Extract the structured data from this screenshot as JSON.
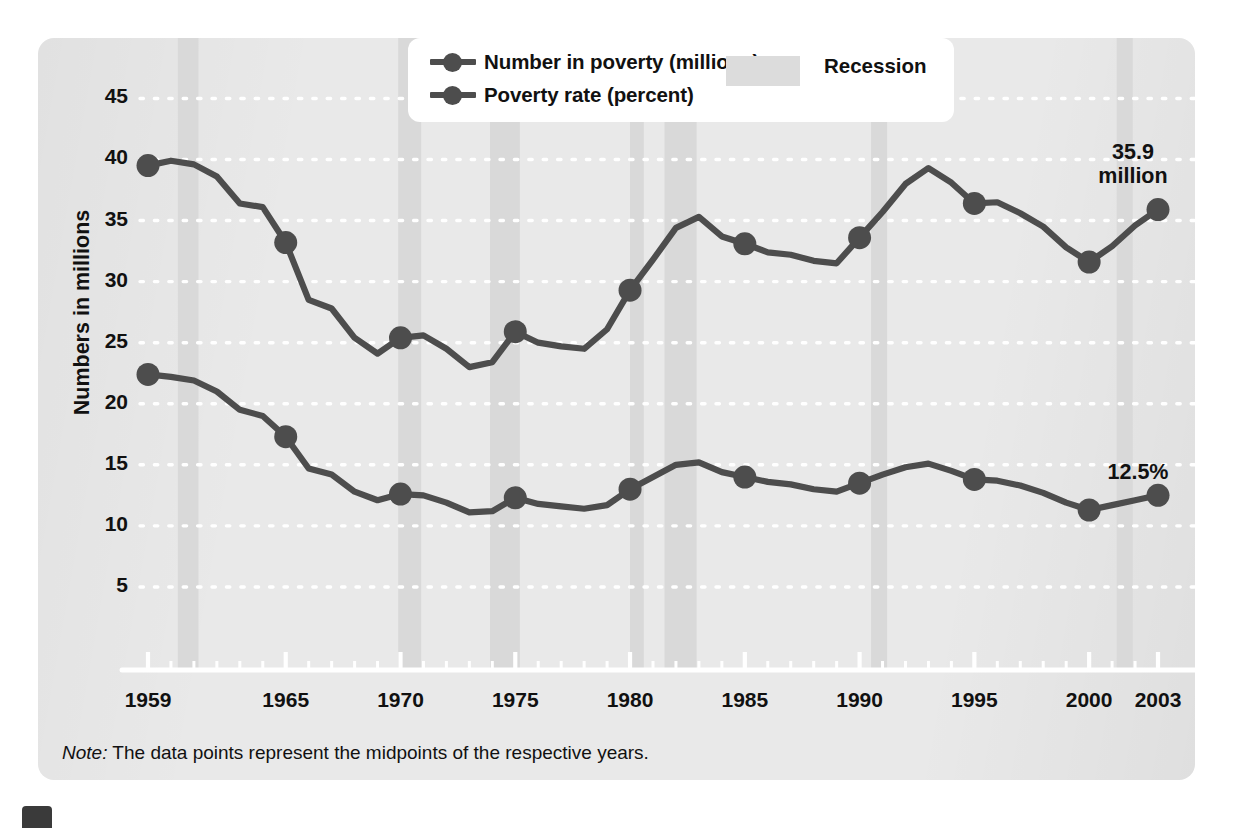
{
  "legend": {
    "number_label": "Number in poverty (millions)",
    "rate_label": "Poverty rate (percent)",
    "recession_label": "Recession"
  },
  "annotations": {
    "number_value": "35.9",
    "number_unit": "million",
    "rate_value": "12.5%"
  },
  "note": {
    "prefix": "Note:",
    "text": " The data points represent the midpoints of the respective years."
  },
  "colors": {
    "series": "#4d4d4d",
    "recession_band": "#d9d9d9",
    "panel": "#e9e9e9",
    "gridline": "#ffffff",
    "axis": "#ffffff",
    "text": "#111111"
  },
  "chart_data": {
    "type": "line",
    "title": "",
    "subtitle": "",
    "xlabel": "",
    "ylabel": "Numbers in millions",
    "xlim": [
      1959,
      2003
    ],
    "ylim": [
      0,
      47
    ],
    "grid": true,
    "gridstyle": "dotted-white-horizontal",
    "legend_position": "top-center",
    "yticks": [
      45,
      40,
      35,
      30,
      25,
      20,
      15,
      10,
      5
    ],
    "xticks": [
      1959,
      1965,
      1970,
      1975,
      1980,
      1985,
      1990,
      1995,
      2000,
      2003
    ],
    "xtick_minor_every": 1,
    "x": [
      1959,
      1960,
      1961,
      1962,
      1963,
      1964,
      1965,
      1966,
      1967,
      1968,
      1969,
      1970,
      1971,
      1972,
      1973,
      1974,
      1975,
      1976,
      1977,
      1978,
      1979,
      1980,
      1981,
      1982,
      1983,
      1984,
      1985,
      1986,
      1987,
      1988,
      1989,
      1990,
      1991,
      1992,
      1993,
      1994,
      1995,
      1996,
      1997,
      1998,
      1999,
      2000,
      2001,
      2002,
      2003
    ],
    "series": [
      {
        "name": "Number in poverty (millions)",
        "units": "millions",
        "marked_years": [
          1959,
          1965,
          1970,
          1975,
          1980,
          1985,
          1990,
          1995,
          2000,
          2003
        ],
        "values": [
          39.5,
          39.9,
          39.6,
          38.6,
          36.4,
          36.1,
          33.2,
          28.5,
          27.8,
          25.4,
          24.1,
          25.4,
          25.6,
          24.5,
          23.0,
          23.4,
          25.9,
          25.0,
          24.7,
          24.5,
          26.1,
          29.3,
          31.8,
          34.4,
          35.3,
          33.7,
          33.1,
          32.4,
          32.2,
          31.7,
          31.5,
          33.6,
          35.7,
          38.0,
          39.3,
          38.1,
          36.4,
          36.5,
          35.6,
          34.5,
          32.8,
          31.6,
          32.9,
          34.6,
          35.9
        ]
      },
      {
        "name": "Poverty rate (percent)",
        "units": "percent",
        "marked_years": [
          1959,
          1965,
          1970,
          1975,
          1980,
          1985,
          1990,
          1995,
          2000,
          2003
        ],
        "values": [
          22.4,
          22.2,
          21.9,
          21.0,
          19.5,
          19.0,
          17.3,
          14.7,
          14.2,
          12.8,
          12.1,
          12.6,
          12.5,
          11.9,
          11.1,
          11.2,
          12.3,
          11.8,
          11.6,
          11.4,
          11.7,
          13.0,
          14.0,
          15.0,
          15.2,
          14.4,
          14.0,
          13.6,
          13.4,
          13.0,
          12.8,
          13.5,
          14.2,
          14.8,
          15.1,
          14.5,
          13.8,
          13.7,
          13.3,
          12.7,
          11.9,
          11.3,
          11.7,
          12.1,
          12.5
        ]
      }
    ],
    "recessions": [
      {
        "start": 1960.3,
        "end": 1961.2
      },
      {
        "start": 1969.9,
        "end": 1970.9
      },
      {
        "start": 1973.9,
        "end": 1975.2
      },
      {
        "start": 1980.0,
        "end": 1980.6
      },
      {
        "start": 1981.5,
        "end": 1982.9
      },
      {
        "start": 1990.5,
        "end": 1991.2
      },
      {
        "start": 2001.2,
        "end": 2001.9
      }
    ]
  }
}
